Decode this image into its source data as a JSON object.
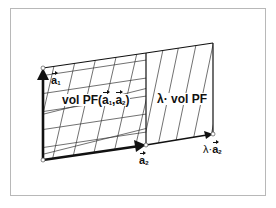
{
  "diagram": {
    "labels": {
      "a1": {
        "letter": "a",
        "sub": "1"
      },
      "a2": {
        "letter": "a",
        "sub": "2"
      },
      "lambda_a2": {
        "prefix": "λ·",
        "letter": "a",
        "sub": "2"
      },
      "vol_pf": {
        "prefix": "vol PF(",
        "a1": "a",
        "sub1": "1",
        "sep": ",",
        "a2": "a",
        "sub2": "2",
        "suffix": ")"
      },
      "lambda_vol_pf": "λ· vol PF"
    },
    "points": {
      "origin": [
        43,
        160
      ],
      "a1_tip": [
        43,
        68
      ],
      "a2_tip": [
        146,
        145
      ],
      "a1_plus_a2": [
        146,
        53
      ],
      "lambda_a2_tip": [
        213,
        134
      ],
      "lambda_a2_plus_a1": [
        213,
        43
      ]
    },
    "colors": {
      "stroke": "#111111",
      "hatch": "#333333",
      "frame": "#b8b8b8",
      "background": "#ffffff"
    }
  }
}
